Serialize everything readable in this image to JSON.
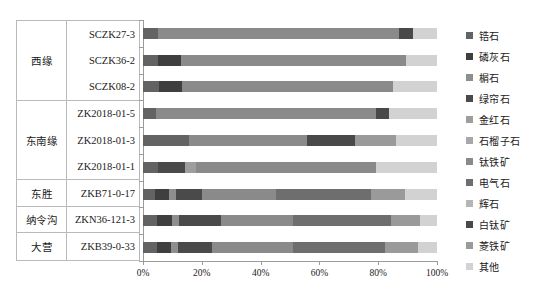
{
  "chart_data": {
    "type": "bar",
    "orientation": "horizontal",
    "stacked": true,
    "normalized": true,
    "title": "",
    "xlabel": "",
    "ylabel": "",
    "xlim": [
      0,
      100
    ],
    "xticks": [
      0,
      20,
      40,
      60,
      80,
      100
    ],
    "xtick_labels": [
      "0%",
      "20%",
      "40%",
      "60%",
      "80%",
      "100%"
    ],
    "grid": false,
    "legend_position": "right",
    "categories": [
      "SCZK27-3",
      "SCZK36-2",
      "SCZK08-2",
      "ZK2018-01-5",
      "ZK2018-01-3",
      "ZK2018-01-1",
      "ZKB71-0-17",
      "ZKN36-121-3",
      "ZKB39-0-33"
    ],
    "series": [
      {
        "name": "锆石",
        "color": "#636363",
        "values": [
          5.1,
          5.0,
          5.4,
          4.4,
          15.6,
          5.1,
          4.2,
          4.7,
          4.6
        ]
      },
      {
        "name": "磷灰石",
        "color": "#3f3f3f",
        "values": [
          0.0,
          7.9,
          7.7,
          0.0,
          0.0,
          0.0,
          4.5,
          5.0,
          4.8
        ]
      },
      {
        "name": "榍石",
        "color": "#8e8e8e",
        "values": [
          0.0,
          0.0,
          0.0,
          0.0,
          0.0,
          0.0,
          2.6,
          2.7,
          2.5
        ]
      },
      {
        "name": "绿帘石",
        "color": "#4a4a4a",
        "values": [
          0.0,
          0.0,
          0.0,
          0.0,
          0.0,
          9.2,
          8.6,
          14.0,
          11.6
        ]
      },
      {
        "name": "金红石",
        "color": "#9e9e9e",
        "values": [
          0.0,
          0.0,
          0.0,
          0.0,
          0.0,
          3.7,
          0.0,
          0.0,
          0.0
        ]
      },
      {
        "name": "石榴子石",
        "color": "#a8a8a8",
        "values": [
          0.0,
          0.0,
          0.0,
          0.0,
          0.0,
          0.0,
          0.0,
          0.0,
          0.0
        ]
      },
      {
        "name": "钛铁矿",
        "color": "#8a8a8a",
        "values": [
          82.0,
          76.7,
          72.1,
          74.9,
          40.1,
          61.2,
          25.4,
          24.5,
          27.4
        ]
      },
      {
        "name": "电气石",
        "color": "#6e6e6e",
        "values": [
          0.0,
          0.0,
          0.0,
          0.0,
          0.0,
          0.0,
          32.4,
          33.3,
          31.5
        ]
      },
      {
        "name": "辉石",
        "color": "#b5b5b5",
        "values": [
          0.0,
          0.0,
          0.0,
          0.0,
          0.0,
          0.0,
          0.0,
          0.0,
          0.0
        ]
      },
      {
        "name": "白钛矿",
        "color": "#494949",
        "values": [
          4.8,
          0.0,
          0.0,
          4.5,
          16.4,
          0.0,
          0.0,
          0.0,
          0.0
        ]
      },
      {
        "name": "菱铁矿",
        "color": "#9a9a9a",
        "values": [
          0.0,
          0.0,
          0.0,
          0.0,
          14.0,
          0.0,
          11.5,
          10.1,
          11.0
        ]
      },
      {
        "name": "其他",
        "color": "#d2d2d2",
        "values": [
          8.1,
          10.4,
          14.8,
          16.2,
          13.9,
          20.8,
          10.8,
          5.7,
          6.6
        ]
      }
    ]
  },
  "left_table": {
    "groups": [
      {
        "label": "西缘",
        "rows": [
          "SCZK27-3",
          "SCZK36-2",
          "SCZK08-2"
        ]
      },
      {
        "label": "东南缘",
        "rows": [
          "ZK2018-01-5",
          "ZK2018-01-3",
          "ZK2018-01-1"
        ]
      },
      {
        "label": "东胜",
        "rows": [
          "ZKB71-0-17"
        ]
      },
      {
        "label": "纳令沟",
        "rows": [
          "ZKN36-121-3"
        ]
      },
      {
        "label": "大营",
        "rows": [
          "ZKB39-0-33"
        ]
      }
    ]
  }
}
